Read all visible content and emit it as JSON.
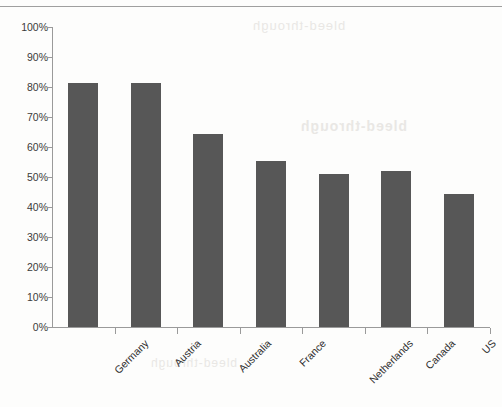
{
  "chart_data": {
    "type": "bar",
    "title": "",
    "subtitle": "",
    "xlabel": "",
    "ylabel": "",
    "categories": [
      "Germany",
      "Austria",
      "Australia",
      "France",
      "Netherlands",
      "Canada",
      "US"
    ],
    "values": [
      81.5,
      81.5,
      64.5,
      55.5,
      51,
      52,
      44.5
    ],
    "series": [
      {
        "name": "",
        "values": [
          81.5,
          81.5,
          64.5,
          55.5,
          51,
          52,
          44.5
        ]
      }
    ],
    "ylim": [
      0,
      100
    ],
    "ytick_labels": [
      "100%",
      "90%",
      "80%",
      "70%",
      "60%",
      "50%",
      "40%",
      "30%",
      "20%",
      "10%",
      "0%"
    ],
    "ytick_values": [
      100,
      90,
      80,
      70,
      60,
      50,
      40,
      30,
      20,
      10,
      0
    ],
    "grid": false,
    "legend": false,
    "legend_position": "none",
    "bar_color": "#575757",
    "axis_color": "#9a9a9a",
    "label_color": "#2f2f2f",
    "background": "#fdfdfc",
    "xlabel_rotation": -45
  },
  "artifacts": {
    "ghost_text_top": "bleed-through",
    "ghost_text_mid": "bleed-through",
    "ghost_text_bottom": "bleed-through"
  }
}
